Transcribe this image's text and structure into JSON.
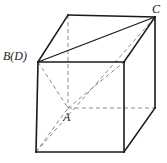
{
  "figure": {
    "name": "cube-projection-diagram",
    "background_color": "#ffffff",
    "solid_stroke_color": "#1a1a1a",
    "dashed_stroke_color": "#8a8a8a",
    "solid_stroke_width": 1.6,
    "thin_stroke_width": 1.0,
    "dashed_stroke_width": 1.0,
    "dash_pattern": "4,3"
  },
  "labels": {
    "b_d": "B(D)",
    "c": "C",
    "a": "A"
  },
  "vertices": {
    "front_top_left": [
      38,
      62
    ],
    "front_top_right": [
      124,
      62
    ],
    "front_bottom_left": [
      36,
      152
    ],
    "front_bottom_right": [
      124,
      152
    ],
    "back_top_left": [
      68,
      15
    ],
    "back_top_right": [
      155,
      17
    ],
    "back_bottom_left": [
      68,
      108
    ],
    "back_bottom_right": [
      155,
      108
    ]
  },
  "edges": {
    "solid": [
      {
        "name": "front-top-edge",
        "from": [
          38,
          62
        ],
        "to": [
          124,
          62
        ]
      },
      {
        "name": "front-left-edge",
        "from": [
          38,
          62
        ],
        "to": [
          36,
          152
        ]
      },
      {
        "name": "front-right-edge",
        "from": [
          124,
          62
        ],
        "to": [
          124,
          152
        ]
      },
      {
        "name": "front-bottom-edge",
        "from": [
          36,
          152
        ],
        "to": [
          124,
          152
        ]
      },
      {
        "name": "top-left-slant-edge",
        "from": [
          38,
          62
        ],
        "to": [
          68,
          15
        ]
      },
      {
        "name": "back-top-edge",
        "from": [
          68,
          15
        ],
        "to": [
          155,
          17
        ]
      },
      {
        "name": "top-right-slant-edge",
        "from": [
          124,
          62
        ],
        "to": [
          155,
          17
        ]
      },
      {
        "name": "back-right-vertical-edge",
        "from": [
          155,
          17
        ],
        "to": [
          155,
          108
        ]
      },
      {
        "name": "bottom-right-slant-edge",
        "from": [
          124,
          152
        ],
        "to": [
          155,
          108
        ]
      }
    ],
    "dashed": [
      {
        "name": "back-left-vertical-hidden-edge",
        "from": [
          68,
          15
        ],
        "to": [
          68,
          108
        ]
      },
      {
        "name": "back-bottom-hidden-edge",
        "from": [
          68,
          108
        ],
        "to": [
          155,
          108
        ]
      },
      {
        "name": "back-left-slant-hidden-edge",
        "from": [
          38,
          62
        ],
        "to": [
          68,
          108
        ]
      },
      {
        "name": "bottom-left-slant-hidden-edge",
        "from": [
          36,
          152
        ],
        "to": [
          68,
          108
        ]
      }
    ]
  },
  "diagonals": {
    "solid": [
      {
        "name": "top-face-diagonal-BD-to-C",
        "from": [
          38,
          62
        ],
        "to": [
          155,
          17
        ]
      }
    ],
    "dashed": [
      {
        "name": "space-diagonal-front-bottom-left-to-C",
        "from": [
          36,
          152
        ],
        "to": [
          155,
          17
        ]
      },
      {
        "name": "hidden-diagonal-A-to-front-top-right",
        "from": [
          68,
          108
        ],
        "to": [
          124,
          62
        ]
      }
    ]
  }
}
